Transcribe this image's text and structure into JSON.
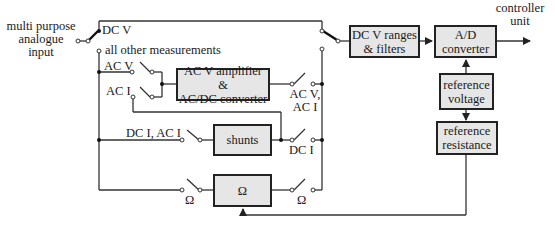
{
  "input": {
    "label_line1": "multi purpose",
    "label_line2": "analogue",
    "label_line3": "input"
  },
  "output": {
    "label_line1": "controller",
    "label_line2": "unit"
  },
  "switch_labels": {
    "dc_v": "DC V",
    "all_other": "all other measurements",
    "ac_v": "AC V",
    "ac_i": "AC I",
    "dc_i_ac_i": "DC I, AC I",
    "ac_v_ac_i_line1": "AC V,",
    "ac_v_ac_i_line2": "AC I",
    "dc_i": "DC I",
    "ohm_left": "Ω",
    "ohm_right": "Ω"
  },
  "blocks": {
    "ac_amp_line1": "AC V amplifier &",
    "ac_amp_line2": "AC/DC converter",
    "shunts": "shunts",
    "ohm": "Ω",
    "dcv_line1": "DC V ranges",
    "dcv_line2": "& filters",
    "adc_line1": "A/D",
    "adc_line2": "converter",
    "refv_line1": "reference",
    "refv_line2": "voltage",
    "refr_line1": "reference",
    "refr_line2": "resistance"
  },
  "colors": {
    "block_fill": "#e6e6e6",
    "line": "#222222"
  }
}
